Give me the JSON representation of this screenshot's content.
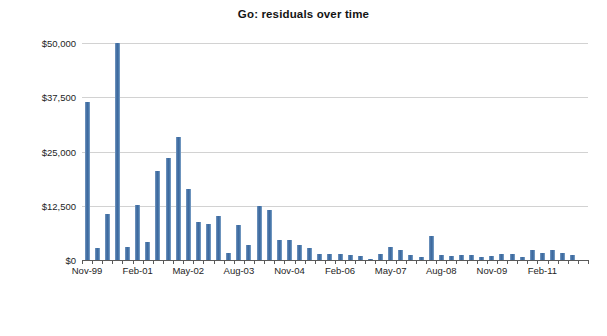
{
  "chart_data": {
    "type": "bar",
    "title": "Go: residuals over time",
    "xlabel": "",
    "ylabel": "",
    "ylim": [
      0,
      50000
    ],
    "xlim_categories": 50,
    "grid": true,
    "legend": null,
    "bar_color": "#4472a8",
    "gridline_color": "#d2d2d2",
    "axis_color": "#5a5a5a",
    "y_ticks": [
      0,
      12500,
      25000,
      37500,
      50000
    ],
    "y_tick_labels": [
      "$0",
      "$12,500",
      "$25,000",
      "$37,500",
      "$50,000"
    ],
    "x_tick_labels": [
      "Nov-99",
      "Feb-01",
      "May-02",
      "Aug-03",
      "Nov-04",
      "Feb-06",
      "May-07",
      "Aug-08",
      "Nov-09",
      "Feb-11"
    ],
    "x_tick_indices": [
      0,
      5,
      10,
      15,
      20,
      25,
      30,
      35,
      40,
      45
    ],
    "categories": [
      "Nov-99",
      "Feb-00",
      "May-00",
      "Aug-00",
      "Nov-00",
      "Feb-01",
      "May-01",
      "Aug-01",
      "Nov-01",
      "Feb-02",
      "May-02",
      "Aug-02",
      "Nov-02",
      "Feb-03",
      "May-03",
      "Aug-03",
      "Nov-03",
      "Feb-04",
      "May-04",
      "Aug-04",
      "Nov-04",
      "Feb-05",
      "May-05",
      "Aug-05",
      "Nov-05",
      "Feb-06",
      "May-06",
      "Aug-06",
      "Nov-06",
      "Feb-07",
      "May-07",
      "Aug-07",
      "Nov-07",
      "Feb-08",
      "May-08",
      "Aug-08",
      "Nov-08",
      "Feb-09",
      "May-09",
      "Aug-09",
      "Nov-09",
      "Feb-10",
      "May-10",
      "Aug-10",
      "Nov-10",
      "Feb-11",
      "May-11",
      "Aug-11",
      "Nov-11",
      "Feb-12"
    ],
    "values": [
      36400,
      2700,
      10700,
      50000,
      3000,
      12700,
      4100,
      20400,
      23600,
      28400,
      16300,
      8700,
      8200,
      10200,
      1700,
      8100,
      3400,
      12500,
      11500,
      4500,
      4500,
      3400,
      2700,
      1300,
      1300,
      1500,
      1200,
      900,
      300,
      1300,
      3100,
      2400,
      1200,
      700,
      5600,
      1200,
      900,
      1200,
      1200,
      700,
      900,
      1400,
      1500,
      600,
      2300,
      1700,
      2300,
      1700,
      1200,
      0
    ]
  }
}
